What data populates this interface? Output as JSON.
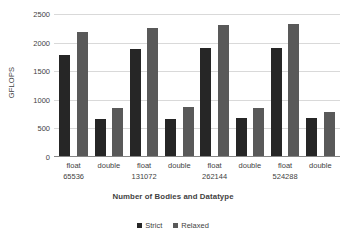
{
  "chart_data": {
    "type": "bar",
    "title": "",
    "xlabel": "Number of Bodies and Datatype",
    "ylabel": "GFLOPS",
    "ylim": [
      0,
      2500
    ],
    "yticks": [
      2500,
      2000,
      1500,
      1000,
      500,
      0
    ],
    "ytick_labels": [
      "2500",
      "2000",
      "1500",
      "1000",
      "500",
      "0"
    ],
    "grid": true,
    "legend_position": "bottom-center",
    "categories": [
      "float",
      "double",
      "float",
      "double",
      "float",
      "double",
      "float",
      "double"
    ],
    "group_labels": [
      "65536",
      "",
      "131072",
      "",
      "262144",
      "",
      "524288",
      ""
    ],
    "groups": [
      {
        "bodies": "65536",
        "datatypes": [
          "float",
          "double"
        ]
      },
      {
        "bodies": "131072",
        "datatypes": [
          "float",
          "double"
        ]
      },
      {
        "bodies": "262144",
        "datatypes": [
          "float",
          "double"
        ]
      },
      {
        "bodies": "524288",
        "datatypes": [
          "float",
          "double"
        ]
      }
    ],
    "series": [
      {
        "name": "Strict",
        "color": "#262626",
        "values": [
          1780,
          670,
          1880,
          670,
          1900,
          680,
          1910,
          675
        ]
      },
      {
        "name": "Relaxed",
        "color": "#595959",
        "values": [
          2180,
          850,
          2250,
          875,
          2310,
          860,
          2320,
          795
        ]
      }
    ]
  },
  "legend": {
    "entries": [
      {
        "label": "Strict"
      },
      {
        "label": "Relaxed"
      }
    ]
  }
}
